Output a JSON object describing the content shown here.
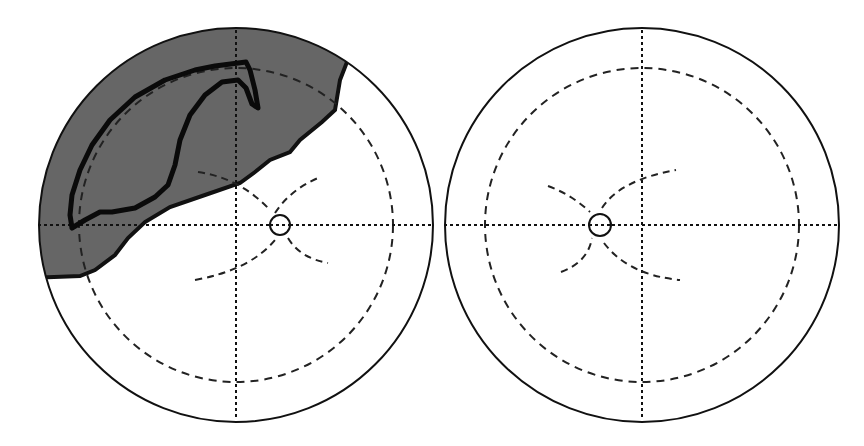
{
  "figure": {
    "type": "visual-field-diagram",
    "panels": [
      {
        "id": "left-eye",
        "label": "",
        "has_defect": true,
        "defect": "superior arcuate scotoma with shaded field loss (upper-left)"
      },
      {
        "id": "right-eye",
        "label": "",
        "has_defect": false
      }
    ]
  },
  "colors": {
    "background": "#ffffff",
    "stroke": "#111111",
    "defect_fill": "#666666",
    "dashed": "#222222"
  }
}
